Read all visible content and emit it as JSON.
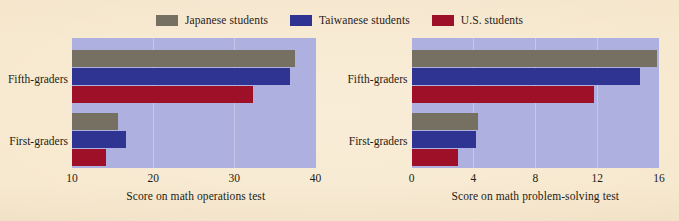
{
  "colors": {
    "page_background": "#f7e8cd",
    "plot_background": "#aeb0e0",
    "gridline": "#c6c7e8",
    "japanese": "#767063",
    "taiwanese": "#2f3391",
    "us": "#9d1027",
    "text": "#241c14"
  },
  "legend": {
    "position": "top-center",
    "items": [
      {
        "label": "Japanese students",
        "color": "#767063",
        "swatch_name": "legend-swatch-japanese"
      },
      {
        "label": "Taiwanese students",
        "color": "#2f3391",
        "swatch_name": "legend-swatch-taiwanese"
      },
      {
        "label": "U.S. students",
        "color": "#9d1027",
        "swatch_name": "legend-swatch-us"
      }
    ]
  },
  "chart_data": [
    {
      "type": "bar",
      "orientation": "horizontal",
      "title": "",
      "xlabel": "Score on math operations test",
      "ylabel": "",
      "categories": [
        "Fifth-graders",
        "First-graders"
      ],
      "xlim": [
        10,
        40
      ],
      "xticks": [
        10,
        20,
        30,
        40
      ],
      "xticklabels": [
        "10",
        "20",
        "30",
        "40"
      ],
      "grid": true,
      "legend": "top-center",
      "series": [
        {
          "name": "Japanese students",
          "color": "#767063",
          "values": [
            37.5,
            15.7
          ]
        },
        {
          "name": "Taiwanese students",
          "color": "#2f3391",
          "values": [
            36.8,
            16.6
          ]
        },
        {
          "name": "U.S. students",
          "color": "#9d1027",
          "values": [
            32.3,
            14.2
          ]
        }
      ]
    },
    {
      "type": "bar",
      "orientation": "horizontal",
      "title": "",
      "xlabel": "Score on math problem-solving test",
      "ylabel": "",
      "categories": [
        "Fifth-graders",
        "First-graders"
      ],
      "xlim": [
        0,
        16
      ],
      "xticks": [
        0,
        4,
        8,
        12,
        16
      ],
      "xticklabels": [
        "0",
        "4",
        "8",
        "12",
        "16"
      ],
      "grid": true,
      "legend": "top-center",
      "series": [
        {
          "name": "Japanese students",
          "color": "#767063",
          "values": [
            15.9,
            4.3
          ]
        },
        {
          "name": "Taiwanese students",
          "color": "#2f3391",
          "values": [
            14.8,
            4.2
          ]
        },
        {
          "name": "U.S. students",
          "color": "#9d1027",
          "values": [
            11.8,
            3.0
          ]
        }
      ]
    }
  ]
}
